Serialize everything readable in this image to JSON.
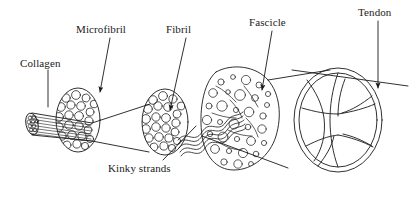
{
  "figure": {
    "type": "anatomical-hierarchy-diagram",
    "background_color": "#ffffff",
    "ink_color": "#1a1a1a"
  },
  "labels": [
    {
      "id": "collagen",
      "text": "Collagen",
      "x": 20,
      "y": 58
    },
    {
      "id": "microfibril",
      "text": "Microfibril",
      "x": 76,
      "y": 24
    },
    {
      "id": "fibril",
      "text": "Fibril",
      "x": 166,
      "y": 24
    },
    {
      "id": "fascicle",
      "text": "Fascicle",
      "x": 249,
      "y": 17
    },
    {
      "id": "tendon",
      "text": "Tendon",
      "x": 358,
      "y": 7
    },
    {
      "id": "kinky-strands",
      "text": "Kinky strands",
      "x": 108,
      "y": 163
    }
  ],
  "leaders": [
    {
      "id": "collagen-leader",
      "from": [
        48,
        70
      ],
      "to": [
        48,
        107
      ],
      "arrow": false
    },
    {
      "id": "microfibril-leader",
      "from": [
        110,
        38
      ],
      "to": [
        100,
        92
      ],
      "arrow": true
    },
    {
      "id": "fibril-leader",
      "from": [
        186,
        38
      ],
      "to": [
        170,
        110
      ],
      "arrow": true
    },
    {
      "id": "fascicle-leader",
      "from": [
        272,
        31
      ],
      "to": [
        262,
        90
      ],
      "arrow": true
    },
    {
      "id": "tendon-leader",
      "from": [
        378,
        21
      ],
      "to": [
        378,
        88
      ],
      "arrow": true
    },
    {
      "id": "kinky-strands-leader",
      "from": [
        163,
        160
      ],
      "to": [
        196,
        126
      ],
      "arrow": false
    }
  ],
  "structures": [
    {
      "id": "collagen-bundle",
      "label": "Collagen",
      "shape": "striated-cylinder"
    },
    {
      "id": "microfibril-disc",
      "label": "Microfibril",
      "shape": "ellipse-packed-circles"
    },
    {
      "id": "fibril-disc",
      "label": "Fibril",
      "shape": "ellipse-packed-circles"
    },
    {
      "id": "kinky-strands",
      "label": "Kinky strands",
      "shape": "wavy-lines"
    },
    {
      "id": "fascicle-blob",
      "label": "Fascicle",
      "shape": "irregular-blob-circles"
    },
    {
      "id": "tendon-section",
      "label": "Tendon",
      "shape": "lobed-oval-cross-section"
    }
  ]
}
